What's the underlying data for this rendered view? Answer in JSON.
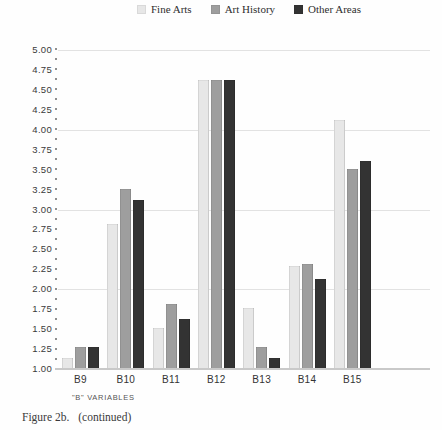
{
  "chart_data": {
    "type": "bar",
    "categories": [
      "B9",
      "B10",
      "B11",
      "B12",
      "B13",
      "B14",
      "B15"
    ],
    "series": [
      {
        "name": "Fine Arts",
        "color": "#e7e7e7",
        "values": [
          1.12,
          2.8,
          1.5,
          4.61,
          1.75,
          2.28,
          4.11
        ]
      },
      {
        "name": "Art History",
        "color": "#9e9e9e",
        "values": [
          1.26,
          3.24,
          1.8,
          4.61,
          1.26,
          2.3,
          3.49
        ]
      },
      {
        "name": "Other Areas",
        "color": "#333333",
        "values": [
          1.26,
          3.11,
          1.62,
          4.61,
          1.12,
          2.11,
          3.6
        ]
      }
    ],
    "title": "",
    "xlabel": "\"B\" VARIABLES",
    "ylabel": "",
    "ylim": [
      1.0,
      5.0
    ],
    "ytick_step": 0.25,
    "ytick_labels": [
      "5.00",
      "4.75",
      "4.50",
      "4.25",
      "4.00",
      "3.75",
      "3.50",
      "3.25",
      "3.00",
      "2.75",
      "2.50",
      "2.25",
      "2.00",
      "1.75",
      "1.50",
      "1.25",
      "1.00"
    ],
    "gridlines_at": [
      5.0,
      4.0,
      3.0,
      2.0
    ],
    "grid": "horizontal-major",
    "legend_position": "top-center"
  },
  "caption": {
    "figure_label": "Figure 2b.",
    "continued": "(continued)"
  }
}
